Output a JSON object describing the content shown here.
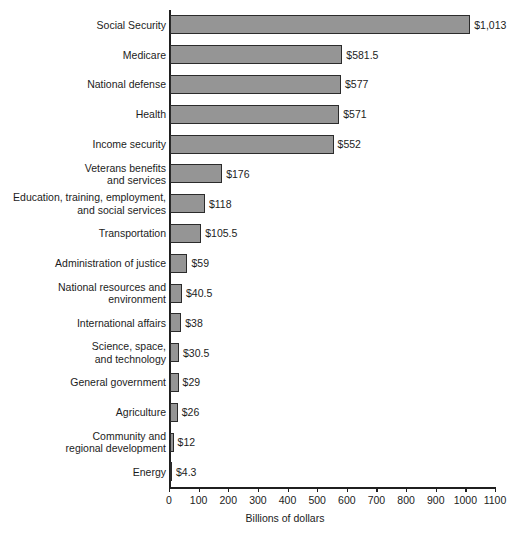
{
  "chart_data": {
    "type": "bar",
    "orientation": "horizontal",
    "title": "",
    "xlabel": "Billions of dollars",
    "ylabel": "",
    "xlim": [
      0,
      1100
    ],
    "xticks": [
      0,
      100,
      200,
      300,
      400,
      500,
      600,
      700,
      800,
      900,
      1000,
      1100
    ],
    "xtick_labels": [
      "0",
      "100",
      "200",
      "300",
      "400",
      "500",
      "600",
      "700",
      "800",
      "900",
      "1000",
      "1100"
    ],
    "grid": false,
    "legend": null,
    "bar_color": "#959595",
    "bar_edge_color": "#2b2b2b",
    "categories": [
      "Social Security",
      "Medicare",
      "National defense",
      "Health",
      "Income security",
      "Veterans benefits and services",
      "Education, training, employment, and social services",
      "Transportation",
      "Administration of justice",
      "National resources and environment",
      "International affairs",
      "Science, space, and technology",
      "General government",
      "Agriculture",
      "Community and regional development",
      "Energy"
    ],
    "values": [
      1013,
      581.5,
      577,
      571,
      552,
      176,
      118,
      105.5,
      59,
      40.5,
      38,
      30.5,
      29,
      26,
      12,
      4.3
    ],
    "data_labels": [
      "$1,013",
      "$581.5",
      "$577",
      "$571",
      "$552",
      "$176",
      "$118",
      "$105.5",
      "$59",
      "$40.5",
      "$38",
      "$30.5",
      "$29",
      "$26",
      "$12",
      "$4.3"
    ],
    "rows": [
      {
        "label_lines": [
          "Social Security"
        ],
        "value": 1013,
        "data_label": "$1,013"
      },
      {
        "label_lines": [
          "Medicare"
        ],
        "value": 581.5,
        "data_label": "$581.5"
      },
      {
        "label_lines": [
          "National defense"
        ],
        "value": 577,
        "data_label": "$577"
      },
      {
        "label_lines": [
          "Health"
        ],
        "value": 571,
        "data_label": "$571"
      },
      {
        "label_lines": [
          "Income security"
        ],
        "value": 552,
        "data_label": "$552"
      },
      {
        "label_lines": [
          "Veterans benefits",
          "and services"
        ],
        "value": 176,
        "data_label": "$176"
      },
      {
        "label_lines": [
          "Education, training, employment,",
          "and social services"
        ],
        "value": 118,
        "data_label": "$118"
      },
      {
        "label_lines": [
          "Transportation"
        ],
        "value": 105.5,
        "data_label": "$105.5"
      },
      {
        "label_lines": [
          "Administration of justice"
        ],
        "value": 59,
        "data_label": "$59"
      },
      {
        "label_lines": [
          "National resources and",
          "environment"
        ],
        "value": 40.5,
        "data_label": "$40.5"
      },
      {
        "label_lines": [
          "International affairs"
        ],
        "value": 38,
        "data_label": "$38"
      },
      {
        "label_lines": [
          "Science, space,",
          "and technology"
        ],
        "value": 30.5,
        "data_label": "$30.5"
      },
      {
        "label_lines": [
          "General government"
        ],
        "value": 29,
        "data_label": "$29"
      },
      {
        "label_lines": [
          "Agriculture"
        ],
        "value": 26,
        "data_label": "$26"
      },
      {
        "label_lines": [
          "Community and",
          "regional development"
        ],
        "value": 12,
        "data_label": "$12"
      },
      {
        "label_lines": [
          "Energy"
        ],
        "value": 4.3,
        "data_label": "$4.3"
      }
    ]
  }
}
